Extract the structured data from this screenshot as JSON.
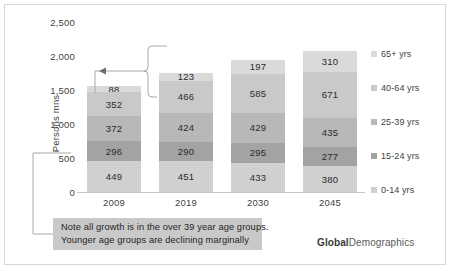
{
  "chart_data": {
    "type": "bar",
    "subtype": "stacked-column",
    "title": "",
    "xlabel": "",
    "ylabel": "Persons mns",
    "categories": [
      "2009",
      "2019",
      "2030",
      "2045"
    ],
    "ylim": [
      0,
      2500
    ],
    "yticks": [
      "0",
      "500",
      "1,000",
      "1,500",
      "2,000",
      "2,500"
    ],
    "ytick_values": [
      0,
      500,
      1000,
      1500,
      2000,
      2500
    ],
    "grid": false,
    "legend_position": "right",
    "stack_order_bottom_to_top": [
      "0-14 yrs",
      "15-24 yrs",
      "25-39 yrs",
      "40-64 yrs",
      "65+ yrs"
    ],
    "series": [
      {
        "name": "0-14 yrs",
        "color": "#d0d0d0",
        "values": [
          449,
          451,
          433,
          380
        ]
      },
      {
        "name": "15-24 yrs",
        "color": "#a3a3a3",
        "values": [
          296,
          290,
          295,
          277
        ]
      },
      {
        "name": "25-39 yrs",
        "color": "#b8b8b8",
        "values": [
          372,
          424,
          429,
          435
        ]
      },
      {
        "name": "40-64 yrs",
        "color": "#c9c9c9",
        "values": [
          352,
          466,
          585,
          671
        ]
      },
      {
        "name": "65+ yrs",
        "color": "#dadada",
        "values": [
          88,
          123,
          197,
          310
        ]
      }
    ],
    "totals": [
      1557,
      1754,
      1939,
      2073
    ],
    "annotations": [
      "Note all growth is in the over 39 year age groups.",
      "Younger age groups are declining marginally"
    ]
  },
  "legend": {
    "items": [
      {
        "label": "65+ yrs",
        "color": "#dadada"
      },
      {
        "label": "40-64 yrs",
        "color": "#c9c9c9"
      },
      {
        "label": "25-39 yrs",
        "color": "#b8b8b8"
      },
      {
        "label": "15-24 yrs",
        "color": "#a3a3a3"
      },
      {
        "label": "0-14 yrs",
        "color": "#d0d0d0"
      }
    ]
  },
  "note": {
    "line1": "Note all growth is in the over 39 year age groups.",
    "line2": "Younger age groups are declining marginally"
  },
  "brand": {
    "bold": "Global",
    "regular": "Demographics"
  }
}
